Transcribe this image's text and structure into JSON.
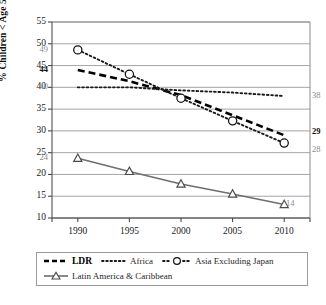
{
  "chart_data": {
    "type": "line",
    "title": "",
    "xlabel": "",
    "ylabel": "% Children < Age 5 Stunted",
    "x": [
      1990,
      1995,
      2000,
      2005,
      2010
    ],
    "xticklabels": [
      "1990",
      "1995",
      "2000",
      "2005",
      "2010"
    ],
    "ylim": [
      10,
      55
    ],
    "yticks": [
      10,
      15,
      20,
      25,
      30,
      35,
      40,
      45,
      50,
      55
    ],
    "yticklabels": [
      "10",
      "15",
      "20",
      "25",
      "30",
      "35",
      "40",
      "45",
      "50",
      "55"
    ],
    "grid": "horizontal",
    "legend_position": "bottom",
    "series": [
      {
        "name": "LDR",
        "style": "dashed",
        "marker": "none",
        "color": "#000000",
        "values": [
          44,
          41.4,
          38.2,
          33.6,
          29
        ],
        "start_label": "44",
        "end_label": "29"
      },
      {
        "name": "Africa",
        "style": "dotted",
        "marker": "none",
        "color": "#1a1a1a",
        "values": [
          40,
          40,
          39.3,
          38.8,
          38
        ],
        "start_label": "40",
        "end_label": "38"
      },
      {
        "name": "Asia Excluding Japan",
        "style": "dotted",
        "marker": "circle",
        "color": "#1a1a1a",
        "values": [
          48.6,
          43,
          37.5,
          32.3,
          27.2
        ],
        "start_label": "49",
        "end_label": "28"
      },
      {
        "name": "Latin America & Caribbean",
        "style": "solid",
        "marker": "triangle",
        "color": "#6e6e6e",
        "values": [
          23.7,
          20.7,
          17.8,
          15.5,
          13.1
        ],
        "start_label": "24",
        "end_label": "14"
      }
    ]
  },
  "legend": {
    "items": [
      {
        "label": "LDR"
      },
      {
        "label": "Africa"
      },
      {
        "label": "Asia Excluding Japan"
      },
      {
        "label": "Latin America & Caribbean"
      }
    ]
  },
  "axis": {
    "y_title": "% Children < Age 5 Stunted"
  }
}
